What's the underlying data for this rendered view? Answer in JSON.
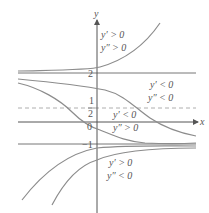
{
  "diagram": {
    "axes": {
      "x_label": "x",
      "y_label": "y"
    },
    "tick_labels": {
      "two": "2",
      "one": "1",
      "half_den": "2",
      "zero": "0",
      "minus_one": "−1"
    },
    "horizontal_lines": [
      {
        "y_value": 2,
        "style": "solid"
      },
      {
        "y_value": 0.5,
        "style": "dashed"
      },
      {
        "y_value": -1,
        "style": "solid"
      }
    ],
    "region_labels": [
      {
        "line1": "y′ > 0",
        "line2": "y″ > 0"
      },
      {
        "line1": "y′ < 0",
        "line2": "y″ < 0"
      },
      {
        "line1": "y′ < 0",
        "line2": "y″ > 0"
      },
      {
        "line1": "y′ > 0",
        "line2": "y″ < 0"
      }
    ],
    "colors": {
      "curve": "#8c8c8c",
      "axis": "#555555",
      "text": "#555555"
    }
  }
}
